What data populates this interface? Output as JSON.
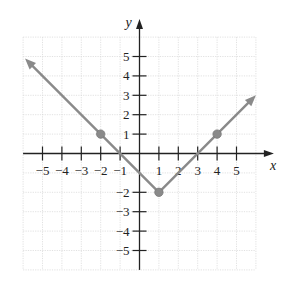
{
  "chart_data": {
    "type": "line",
    "title": "",
    "function_description": "absolute value graph, vertex at (1, -2)",
    "xlabel": "x",
    "ylabel": "y",
    "xlim": [
      -6,
      6
    ],
    "ylim": [
      -6,
      6
    ],
    "grid": true,
    "x_ticks": [
      -5,
      -4,
      -3,
      -2,
      -1,
      1,
      2,
      3,
      4,
      5
    ],
    "y_ticks": [
      5,
      4,
      3,
      2,
      1,
      -2,
      -3,
      -4,
      -5
    ],
    "x_tick_labels": [
      "−5",
      "−4",
      "−3",
      "−2",
      "−1",
      "1",
      "2",
      "3",
      "4",
      "5"
    ],
    "y_tick_labels": [
      "5",
      "4",
      "3",
      "2",
      "1",
      "−2",
      "−3",
      "−4",
      "−5"
    ],
    "series": [
      {
        "name": "f(x)",
        "color": "#8a8a8a",
        "x": [
          -5.9,
          1,
          6
        ],
        "y": [
          4.9,
          -2,
          3
        ],
        "arrows": [
          "start",
          "end"
        ]
      }
    ],
    "points": [
      {
        "x": -2,
        "y": 1
      },
      {
        "x": -1,
        "y": 0
      },
      {
        "x": 0,
        "y": -1
      },
      {
        "x": 1,
        "y": -2
      },
      {
        "x": 2,
        "y": -1
      },
      {
        "x": 3,
        "y": 0
      },
      {
        "x": 4,
        "y": 1
      }
    ],
    "marked_points": [
      {
        "x": -2,
        "y": 1
      },
      {
        "x": 1,
        "y": -2
      },
      {
        "x": 4,
        "y": 1
      }
    ]
  }
}
